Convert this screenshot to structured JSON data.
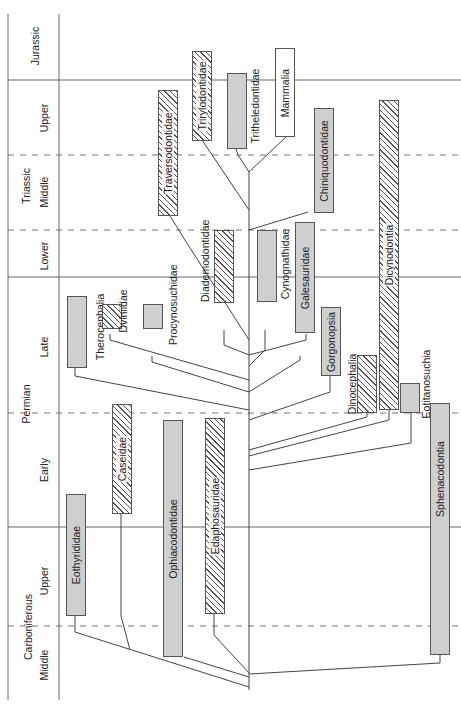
{
  "time_scale": {
    "systems": [
      {
        "name": "Jurassic"
      },
      {
        "name": "Triassic"
      },
      {
        "name": "Permian"
      },
      {
        "name": "Carboniferous"
      }
    ],
    "stages": [
      {
        "name": "Jurassic"
      },
      {
        "name": "Upper"
      },
      {
        "name": "Middle"
      },
      {
        "name": "Lower"
      },
      {
        "name": "Late"
      },
      {
        "name": "Early"
      },
      {
        "name": "Upper"
      },
      {
        "name": "Middle"
      }
    ]
  },
  "taxa": [
    {
      "name": "Eothyrididae",
      "style": "solid"
    },
    {
      "name": "Caseidae",
      "style": "hatched"
    },
    {
      "name": "Ophiacodontidae",
      "style": "solid"
    },
    {
      "name": "Edaphosauridae",
      "style": "hatched"
    },
    {
      "name": "Therocephalia",
      "style": "solid"
    },
    {
      "name": "Dviniidae",
      "style": "hatched"
    },
    {
      "name": "Procynosuchidae",
      "style": "solid"
    },
    {
      "name": "Traversodontidae",
      "style": "hatched"
    },
    {
      "name": "Diademodontidae",
      "style": "hatched"
    },
    {
      "name": "Trirylodontidae",
      "style": "hatched"
    },
    {
      "name": "Tritheledontidae",
      "style": "solid"
    },
    {
      "name": "Mammalia",
      "style": "white"
    },
    {
      "name": "Cynognathidae",
      "style": "solid"
    },
    {
      "name": "Galesauridae",
      "style": "solid"
    },
    {
      "name": "Chiniquodontidae",
      "style": "solid"
    },
    {
      "name": "Gorgonopsia",
      "style": "solid"
    },
    {
      "name": "Dinocephalia",
      "style": "hatched"
    },
    {
      "name": "Dicynodontia",
      "style": "hatched"
    },
    {
      "name": "Eotitanosuchia",
      "style": "solid"
    },
    {
      "name": "Sphenacodontia",
      "style": "solid"
    }
  ],
  "colors": {
    "line": "#555555",
    "solid_fill": "#cfcfcf",
    "hatch": "#555555",
    "text": "#222222"
  }
}
